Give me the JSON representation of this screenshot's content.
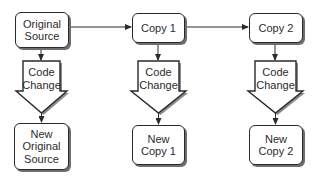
{
  "diagram": {
    "type": "flowchart",
    "colors": {
      "stroke": "#2a2a2a",
      "shadow": "#6e6e6e",
      "fill": "#ffffff",
      "text": "#2b2b2b"
    },
    "top_row": [
      {
        "id": "original_source",
        "label": "Original\nSource"
      },
      {
        "id": "copy_1",
        "label": "Copy 1"
      },
      {
        "id": "copy_2",
        "label": "Copy 2"
      }
    ],
    "block_arrows": [
      {
        "label": "Code\nChange"
      },
      {
        "label": "Code\nChange"
      },
      {
        "label": "Code\nChange"
      }
    ],
    "bottom_row": [
      {
        "id": "new_original_source",
        "label": "New\nOriginal\nSource"
      },
      {
        "id": "new_copy_1",
        "label": "New\nCopy 1"
      },
      {
        "id": "new_copy_2",
        "label": "New\nCopy 2"
      }
    ],
    "edges": [
      {
        "from": "original_source",
        "to": "copy_1"
      },
      {
        "from": "copy_1",
        "to": "copy_2"
      },
      {
        "from": "original_source",
        "to": "new_original_source",
        "via": "Code Change"
      },
      {
        "from": "copy_1",
        "to": "new_copy_1",
        "via": "Code Change"
      },
      {
        "from": "copy_2",
        "to": "new_copy_2",
        "via": "Code Change"
      }
    ]
  }
}
